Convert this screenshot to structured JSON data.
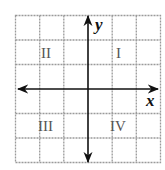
{
  "diagram": {
    "grid": {
      "columns": 6,
      "rows": 6,
      "line_color": "#9a9a9a",
      "style": "dashed"
    },
    "axes": {
      "x_label": "x",
      "y_label": "y",
      "color": "#111111"
    },
    "quadrants": [
      {
        "id": "I",
        "label": "I"
      },
      {
        "id": "II",
        "label": "II"
      },
      {
        "id": "III",
        "label": "III"
      },
      {
        "id": "IV",
        "label": "IV"
      }
    ]
  }
}
